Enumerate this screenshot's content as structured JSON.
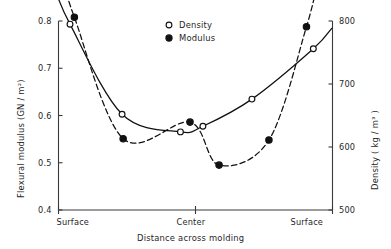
{
  "chart_data": {
    "type": "line",
    "title": "",
    "xlabel": "Distance across molding",
    "x_tick_labels": [
      "Surface",
      "Center",
      "Surface"
    ],
    "x_tick_positions": [
      0,
      0.5,
      1
    ],
    "grid": false,
    "legend_position": "top-center",
    "left_axis": {
      "label": "Flexural modulus  (GN / m²)",
      "unit": "GN / m²",
      "ylim": [
        0.4,
        0.8
      ],
      "ticks": [
        0.4,
        0.5,
        0.6,
        0.7,
        0.8
      ],
      "tick_labels": [
        "0.4",
        "0.5",
        "0.6",
        "0.7",
        "0.8"
      ]
    },
    "right_axis": {
      "label": "Density  ( kg / m³ )",
      "unit": "kg / m³",
      "ylim": [
        500,
        800
      ],
      "ticks": [
        500,
        600,
        700,
        800
      ],
      "tick_labels": [
        "500",
        "600",
        "700",
        "800"
      ]
    },
    "series": [
      {
        "name": "Density",
        "marker": "open-circle",
        "line_style": "solid",
        "axis": "right",
        "color": "#111111",
        "x": [
          0.042,
          0.232,
          0.445,
          0.527,
          0.706,
          0.93
        ],
        "values": [
          795,
          652,
          624,
          633,
          676,
          756
        ],
        "values_left_axis_equivalent": [
          0.773,
          0.603,
          0.565,
          0.578,
          0.635,
          0.74
        ]
      },
      {
        "name": "Modulus",
        "marker": "filled-circle",
        "line_style": "dashed",
        "axis": "left",
        "color": "#111111",
        "x": [
          0.058,
          0.236,
          0.48,
          0.586,
          0.768,
          0.905
        ],
        "values": [
          0.808,
          0.551,
          0.586,
          0.495,
          0.548,
          0.788
        ]
      }
    ],
    "legend": [
      {
        "label": "Density",
        "marker": "open-circle"
      },
      {
        "label": "Modulus",
        "marker": "filled-circle"
      }
    ]
  }
}
